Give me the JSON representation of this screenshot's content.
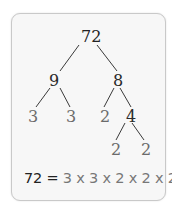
{
  "diagram": {
    "type": "factor-tree",
    "root": "72",
    "nodes": {
      "n72": "72",
      "n9": "9",
      "n8": "8",
      "n3a": "3",
      "n3b": "3",
      "n2a": "2",
      "n4": "4",
      "n2b": "2",
      "n2c": "2"
    },
    "edges": [
      [
        "72",
        "9"
      ],
      [
        "72",
        "8"
      ],
      [
        "9",
        "3"
      ],
      [
        "9",
        "3"
      ],
      [
        "8",
        "2"
      ],
      [
        "8",
        "4"
      ],
      [
        "4",
        "2"
      ],
      [
        "4",
        "2"
      ]
    ],
    "equation": {
      "lhs": "72 =",
      "rhs": " 3 x 3 x 2 x 2 x 2"
    }
  },
  "colors": {
    "card_bg": "#f7f7f7",
    "card_border": "#c9c9c9",
    "line": "#333333",
    "leaf_text": "#6b6b6b",
    "composite_text": "#222222"
  }
}
